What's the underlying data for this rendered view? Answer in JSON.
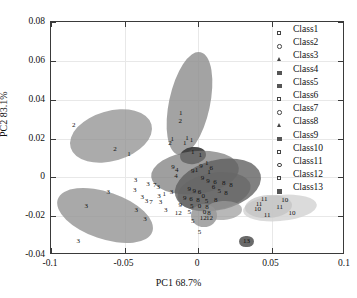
{
  "chart_data": {
    "type": "scatter",
    "title": "",
    "xlabel": "PC1 68.7%",
    "ylabel": "PC2 83.1%",
    "xlim": [
      -0.1,
      0.1
    ],
    "ylim": [
      -0.04,
      0.08
    ],
    "xticks": [
      "-0.1",
      "-0.05",
      "0",
      "0.05",
      "0.1"
    ],
    "xtickvals": [
      -0.1,
      -0.05,
      0,
      0.05,
      0.1
    ],
    "yticks": [
      "0.08",
      "0.06",
      "0.04",
      "0.02",
      "0",
      "-0.02",
      "-0.04"
    ],
    "ytickvals": [
      0.08,
      0.06,
      0.04,
      0.02,
      0,
      -0.02,
      -0.04
    ],
    "grid": true,
    "legend_position": "outside-top-right",
    "legend": [
      {
        "label": "Class1",
        "marker": "square-open"
      },
      {
        "label": "Class2",
        "marker": "circle-open"
      },
      {
        "label": "Class3",
        "marker": "triangle-open"
      },
      {
        "label": "Class4",
        "marker": "dot-filled"
      },
      {
        "label": "Class5",
        "marker": "dot-filled"
      },
      {
        "label": "Class6",
        "marker": "square-open"
      },
      {
        "label": "Class7",
        "marker": "circle-open"
      },
      {
        "label": "Class8",
        "marker": "triangle-open"
      },
      {
        "label": "Class9",
        "marker": "dot-filled"
      },
      {
        "label": "Class10",
        "marker": "square-open"
      },
      {
        "label": "Class11",
        "marker": "circle-open"
      },
      {
        "label": "Class12",
        "marker": "square-open"
      },
      {
        "label": "Class13",
        "marker": "dot-filled"
      }
    ],
    "confidence_ellipses": [
      {
        "group": "Class2",
        "cx": -0.0595,
        "cy": 0.0215,
        "rx": 0.0285,
        "ry": 0.0128,
        "rot": -16,
        "fill": "#8f8f8f",
        "alpha": 0.75
      },
      {
        "group": "Class3",
        "cx": -0.063,
        "cy": -0.0198,
        "rx": 0.034,
        "ry": 0.0122,
        "rot": 19,
        "fill": "#949494",
        "alpha": 0.8
      },
      {
        "group": "Class1",
        "cx": -0.006,
        "cy": 0.038,
        "rx": 0.0138,
        "ry": 0.027,
        "rot": 12,
        "fill": "#8c8c8c",
        "alpha": 0.8
      },
      {
        "group": "Class4",
        "cx": -0.003,
        "cy": 0.0115,
        "rx": 0.009,
        "ry": 0.0043,
        "rot": -8,
        "fill": "#3a3a3a",
        "alpha": 0.92
      },
      {
        "group": "Class7",
        "cx": -0.002,
        "cy": 0.0025,
        "rx": 0.03,
        "ry": 0.011,
        "rot": -6,
        "fill": "#7a7a7a",
        "alpha": 0.72
      },
      {
        "group": "Class8",
        "cx": 0.014,
        "cy": -0.004,
        "rx": 0.03,
        "ry": 0.013,
        "rot": -14,
        "fill": "#5e5e5e",
        "alpha": 0.78
      },
      {
        "group": "Class9",
        "cx": 0.0105,
        "cy": -0.0075,
        "rx": 0.025,
        "ry": 0.0095,
        "rot": -10,
        "fill": "#666666",
        "alpha": 0.7
      },
      {
        "group": "Class5",
        "cx": 0.004,
        "cy": -0.0195,
        "rx": 0.009,
        "ry": 0.006,
        "rot": 0,
        "fill": "#8a8a8a",
        "alpha": 0.75
      },
      {
        "group": "Class12",
        "cx": 0.017,
        "cy": -0.0168,
        "rx": 0.013,
        "ry": 0.0048,
        "rot": -4,
        "fill": "#9a9a9a",
        "alpha": 0.7
      },
      {
        "group": "Class10",
        "cx": 0.0555,
        "cy": -0.016,
        "rx": 0.025,
        "ry": 0.0068,
        "rot": -5,
        "fill": "#d5d5d5",
        "alpha": 0.85
      },
      {
        "group": "Class11",
        "cx": 0.048,
        "cy": -0.0148,
        "rx": 0.016,
        "ry": 0.0058,
        "rot": -4,
        "fill": "#c2c2c2",
        "alpha": 0.7
      },
      {
        "group": "Class13",
        "cx": 0.033,
        "cy": -0.033,
        "rx": 0.0048,
        "ry": 0.003,
        "rot": 0,
        "fill": "#5a5a5a",
        "alpha": 0.9
      }
    ],
    "points": [
      {
        "label": "2",
        "x": -0.0845,
        "y": 0.0272
      },
      {
        "label": "2",
        "x": -0.0565,
        "y": 0.0145
      },
      {
        "label": "1",
        "x": -0.047,
        "y": 0.0118
      },
      {
        "label": "3",
        "x": -0.0425,
        "y": -0.0012
      },
      {
        "label": "3",
        "x": -0.034,
        "y": -0.0036
      },
      {
        "label": "7",
        "x": -0.0295,
        "y": -0.004
      },
      {
        "label": "3",
        "x": -0.076,
        "y": -0.0148
      },
      {
        "label": "3",
        "x": -0.0815,
        "y": -0.033
      },
      {
        "label": "3",
        "x": -0.061,
        "y": -0.0075
      },
      {
        "label": "3",
        "x": -0.043,
        "y": -0.0065
      },
      {
        "label": "3",
        "x": -0.038,
        "y": -0.01
      },
      {
        "label": "3",
        "x": -0.035,
        "y": -0.012
      },
      {
        "label": "7",
        "x": -0.032,
        "y": -0.0128
      },
      {
        "label": "3",
        "x": -0.042,
        "y": -0.017
      },
      {
        "label": "3",
        "x": -0.036,
        "y": -0.0215
      },
      {
        "label": "3",
        "x": -0.0265,
        "y": -0.0095
      },
      {
        "label": "3",
        "x": -0.0255,
        "y": -0.0125
      },
      {
        "label": "3",
        "x": -0.022,
        "y": -0.0168
      },
      {
        "label": "3",
        "x": -0.027,
        "y": -0.0052
      },
      {
        "label": "1",
        "x": -0.023,
        "y": -0.0088
      },
      {
        "label": "3",
        "x": -0.018,
        "y": -0.0075
      },
      {
        "label": "1",
        "x": -0.0118,
        "y": 0.033
      },
      {
        "label": "2",
        "x": -0.012,
        "y": 0.029
      },
      {
        "label": "1",
        "x": -0.0175,
        "y": 0.0198
      },
      {
        "label": "1",
        "x": -0.0075,
        "y": 0.0205
      },
      {
        "label": "2",
        "x": -0.019,
        "y": 0.0178
      },
      {
        "label": "1",
        "x": -0.009,
        "y": 0.0178
      },
      {
        "label": "1",
        "x": -0.0045,
        "y": 0.019
      },
      {
        "label": "1",
        "x": -0.0035,
        "y": 0.0132
      },
      {
        "label": "1",
        "x": 0.0015,
        "y": 0.0115
      },
      {
        "label": "9",
        "x": 0.002,
        "y": 0.0058
      },
      {
        "label": "1",
        "x": 0.006,
        "y": 0.0075
      },
      {
        "label": "6",
        "x": 0.009,
        "y": 0.005
      },
      {
        "label": "4",
        "x": -0.0145,
        "y": 0.004
      },
      {
        "label": "9",
        "x": -0.017,
        "y": 0.0052
      },
      {
        "label": "4",
        "x": -0.015,
        "y": 0.0008
      },
      {
        "label": "9",
        "x": -0.0035,
        "y": 0.0032
      },
      {
        "label": "1",
        "x": -0.001,
        "y": 0.004
      },
      {
        "label": "1",
        "x": 0.0075,
        "y": 0.0028
      },
      {
        "label": "6",
        "x": 0.0115,
        "y": -0.0022
      },
      {
        "label": "9",
        "x": 0.003,
        "y": -0.0002
      },
      {
        "label": "9",
        "x": 0.0068,
        "y": -0.002
      },
      {
        "label": "6",
        "x": 0.0105,
        "y": -0.005
      },
      {
        "label": "8",
        "x": 0.0175,
        "y": -0.003
      },
      {
        "label": "8",
        "x": 0.0225,
        "y": -0.0042
      },
      {
        "label": "9",
        "x": -0.006,
        "y": -0.0062
      },
      {
        "label": "9",
        "x": -0.0025,
        "y": -0.0072
      },
      {
        "label": "6",
        "x": 0.001,
        "y": -0.0078
      },
      {
        "label": "0",
        "x": 0.0035,
        "y": -0.0095
      },
      {
        "label": "5",
        "x": 0.0145,
        "y": -0.0068
      },
      {
        "label": "8",
        "x": 0.019,
        "y": -0.0082
      },
      {
        "label": "9",
        "x": -0.009,
        "y": -0.0105
      },
      {
        "label": "6",
        "x": -0.0048,
        "y": -0.0112
      },
      {
        "label": "8",
        "x": 0.0,
        "y": -0.0118
      },
      {
        "label": "5",
        "x": 0.0058,
        "y": -0.012
      },
      {
        "label": "8",
        "x": 0.012,
        "y": -0.0118
      },
      {
        "label": "9",
        "x": -0.012,
        "y": -0.014
      },
      {
        "label": "5",
        "x": -0.0042,
        "y": -0.0148
      },
      {
        "label": "0",
        "x": 0.001,
        "y": -0.015
      },
      {
        "label": "8",
        "x": 0.0062,
        "y": -0.0152
      },
      {
        "label": "12",
        "x": -0.0135,
        "y": -0.0185
      },
      {
        "label": "5",
        "x": -0.006,
        "y": -0.0178
      },
      {
        "label": "0",
        "x": 0.0045,
        "y": -0.018
      },
      {
        "label": "8",
        "x": 0.0075,
        "y": -0.0182
      },
      {
        "label": "5",
        "x": -0.0035,
        "y": -0.0225
      },
      {
        "label": "12",
        "x": 0.0035,
        "y": -0.0212
      },
      {
        "label": "12",
        "x": 0.0078,
        "y": -0.0212
      },
      {
        "label": "5",
        "x": 0.001,
        "y": -0.028
      },
      {
        "label": "11",
        "x": 0.045,
        "y": -0.0112
      },
      {
        "label": "10",
        "x": 0.059,
        "y": -0.0118
      },
      {
        "label": "1",
        "x": 0.0405,
        "y": -0.0135
      },
      {
        "label": "1",
        "x": 0.0425,
        "y": -0.0135
      },
      {
        "label": "10",
        "x": 0.0405,
        "y": -0.0165
      },
      {
        "label": "11",
        "x": 0.0555,
        "y": -0.0155
      },
      {
        "label": "10",
        "x": 0.064,
        "y": -0.0185
      },
      {
        "label": "11",
        "x": 0.047,
        "y": -0.0195
      },
      {
        "label": "13",
        "x": 0.033,
        "y": -0.033
      }
    ]
  }
}
